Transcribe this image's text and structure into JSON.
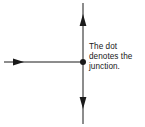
{
  "canvas": {
    "width": 145,
    "height": 127,
    "background_color": "#ffffff"
  },
  "diagram": {
    "type": "junction-schematic",
    "stroke_color": "#1a1a1a",
    "line_width": 1,
    "junction": {
      "label_name": "junction-dot",
      "x": 83,
      "y": 62,
      "radius": 3,
      "fill_color": "#1a1a1a"
    },
    "wires": [
      {
        "name": "horizontal-wire",
        "orientation": "horizontal",
        "x1": 4,
        "y1": 62,
        "x2": 83,
        "y2": 62,
        "arrows": [
          {
            "name": "right-arrowhead",
            "direction": "right",
            "tip_x": 24,
            "tip_y": 62
          }
        ]
      },
      {
        "name": "vertical-wire",
        "orientation": "vertical",
        "x1": 83,
        "y1": 3,
        "x2": 83,
        "y2": 124,
        "arrows": [
          {
            "name": "up-arrowhead",
            "direction": "up",
            "tip_x": 83,
            "tip_y": 14
          },
          {
            "name": "down-arrowhead",
            "direction": "down",
            "tip_x": 83,
            "tip_y": 109
          }
        ]
      }
    ]
  },
  "caption": {
    "text_color": "#202020",
    "lines": [
      "The dot",
      "denotes the",
      "junction."
    ],
    "full_text": "The dot denotes the junction."
  }
}
